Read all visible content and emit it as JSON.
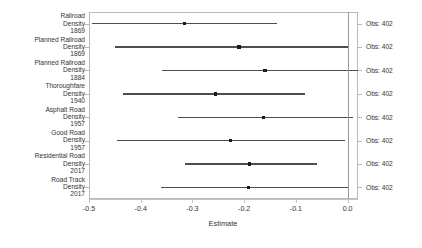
{
  "chart_data": {
    "type": "scatter",
    "title": "",
    "subtitle": "",
    "xlabel": "Estimate",
    "ylabel": "",
    "xlim": [
      -0.5,
      0.02
    ],
    "ylim": [
      0,
      8
    ],
    "grid": false,
    "legend": null,
    "zero_reference_line": 0.0,
    "xticks": [
      -0.5,
      -0.4,
      -0.3,
      -0.2,
      -0.1,
      0.0
    ],
    "xticklabels": [
      "-0.5",
      "-0.4",
      "-0.3",
      "-0.2",
      "-0.1",
      "0.0"
    ],
    "categories": [
      "Railroad Density 1869",
      "Planned Railroad Density 1869",
      "Planned Railroad Density 1884",
      "Thoroughfare Density 1940",
      "Asphalt Road Density 1957",
      "Good Road Density 1957",
      "Residential Road Density 2017",
      "Road Track Density 2017"
    ],
    "category_lines": [
      [
        "Railroad",
        "Density",
        "1869"
      ],
      [
        "Planned Railroad",
        "Density",
        "1869"
      ],
      [
        "Planned Railroad",
        "Density",
        "1884"
      ],
      [
        "Thoroughfare",
        "Density",
        "1940"
      ],
      [
        "Asphalt Road",
        "Density",
        "1957"
      ],
      [
        "Good Road",
        "Density",
        "1957"
      ],
      [
        "Residential Road",
        "Density",
        "2017"
      ],
      [
        "Road Track",
        "Density",
        "2017"
      ]
    ],
    "points": [
      {
        "label": "Railroad Density 1869",
        "estimate": -0.315,
        "ci_low": -0.494,
        "ci_high": -0.136,
        "obs": 402
      },
      {
        "label": "Planned Railroad Density 1869",
        "estimate": -0.21,
        "ci_low": -0.45,
        "ci_high": 0.0,
        "obs": 402
      },
      {
        "label": "Planned Railroad Density 1884",
        "estimate": -0.16,
        "ci_low": -0.359,
        "ci_high": 0.02,
        "obs": 402
      },
      {
        "label": "Thoroughfare Density 1940",
        "estimate": -0.255,
        "ci_low": -0.435,
        "ci_high": -0.083,
        "obs": 402
      },
      {
        "label": "Asphalt Road Density 1957",
        "estimate": -0.163,
        "ci_low": -0.328,
        "ci_high": 0.01,
        "obs": 402
      },
      {
        "label": "Good Road Density 1957",
        "estimate": -0.227,
        "ci_low": -0.446,
        "ci_high": -0.006,
        "obs": 402
      },
      {
        "label": "Residential Road Density 2017",
        "estimate": -0.19,
        "ci_low": -0.315,
        "ci_high": -0.059,
        "obs": 402
      },
      {
        "label": "Road Track Density 2017",
        "estimate": -0.192,
        "ci_low": -0.36,
        "ci_high": 0.0,
        "obs": 402
      }
    ],
    "annotations": [
      "Obs: 402",
      "Obs: 402",
      "Obs: 402",
      "Obs: 402",
      "Obs: 402",
      "Obs: 402",
      "Obs: 402",
      "Obs: 402"
    ],
    "colors": {
      "point": "#1a1a1a",
      "interval": "#4d4d4d",
      "zero_line": "#9a9a9a",
      "panel_border": "#b9b9b9",
      "axis": "#c4c4c4",
      "text": "#333333",
      "background": "#ffffff"
    }
  }
}
